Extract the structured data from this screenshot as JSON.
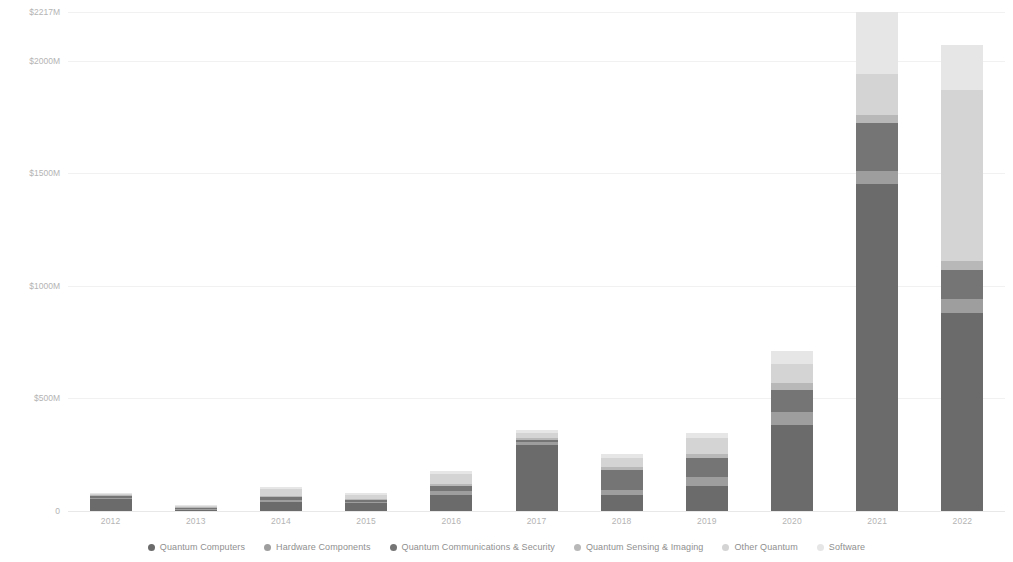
{
  "chart_data": {
    "type": "bar",
    "stacked": true,
    "title": "",
    "subtitle": "",
    "xlabel": "",
    "ylabel": "",
    "grid": true,
    "legend_position": "bottom",
    "ylim": [
      0,
      2217
    ],
    "y_ticks": [
      "0",
      "$500M",
      "$1000M",
      "$1500M",
      "$2000M",
      "$2217M"
    ],
    "y_tick_values": [
      0,
      500,
      1000,
      1500,
      2000,
      2217
    ],
    "categories": [
      "2012",
      "2013",
      "2014",
      "2015",
      "2016",
      "2017",
      "2018",
      "2019",
      "2020",
      "2021",
      "2022"
    ],
    "series": [
      {
        "name": "Quantum Computers",
        "color": "#6b6b6b",
        "values": [
          52,
          4,
          42,
          35,
          72,
          295,
          70,
          112,
          380,
          1455,
          880
        ]
      },
      {
        "name": "Hardware Components",
        "color": "#9e9e9e",
        "values": [
          8,
          2,
          8,
          6,
          18,
          12,
          22,
          40,
          62,
          55,
          62
        ]
      },
      {
        "name": "Quantum Communications & Security",
        "color": "#757575",
        "values": [
          6,
          1,
          12,
          7,
          22,
          10,
          90,
          82,
          95,
          215,
          128
        ]
      },
      {
        "name": "Quantum Sensing & Imaging",
        "color": "#b8b8b8",
        "values": [
          3,
          1,
          6,
          5,
          10,
          8,
          14,
          18,
          30,
          35,
          42
        ]
      },
      {
        "name": "Other Quantum",
        "color": "#d4d4d4",
        "values": [
          4,
          1,
          30,
          18,
          44,
          22,
          38,
          72,
          88,
          180,
          760
        ]
      },
      {
        "name": "Software",
        "color": "#e6e6e6",
        "values": [
          3,
          1,
          10,
          7,
          14,
          14,
          18,
          24,
          54,
          277,
          198
        ]
      }
    ]
  },
  "legend": {
    "items": [
      {
        "label": "Quantum Computers",
        "color": "#6b6b6b"
      },
      {
        "label": "Hardware Components",
        "color": "#9e9e9e"
      },
      {
        "label": "Quantum Communications & Security",
        "color": "#757575"
      },
      {
        "label": "Quantum Sensing & Imaging",
        "color": "#b8b8b8"
      },
      {
        "label": "Other Quantum",
        "color": "#d4d4d4"
      },
      {
        "label": "Software",
        "color": "#e6e6e6"
      }
    ]
  }
}
